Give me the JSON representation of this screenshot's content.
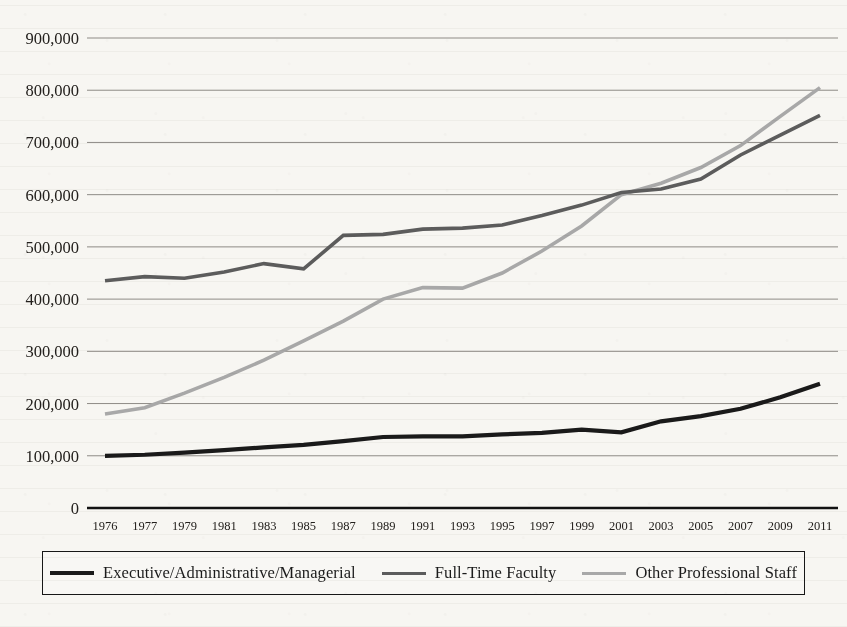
{
  "chart_data": {
    "type": "line",
    "title": "",
    "subtitle": "",
    "xlabel": "",
    "ylabel": "",
    "grid": true,
    "legend_position": "bottom",
    "x": [
      "1976",
      "1977",
      "1979",
      "1981",
      "1983",
      "1985",
      "1987",
      "1989",
      "1991",
      "1993",
      "1995",
      "1997",
      "1999",
      "2001",
      "2003",
      "2005",
      "2007",
      "2009",
      "2011"
    ],
    "xlim": [
      "1976",
      "2011"
    ],
    "ylim": [
      0,
      900000
    ],
    "ytick_values": [
      0,
      100000,
      200000,
      300000,
      400000,
      500000,
      600000,
      700000,
      800000,
      900000
    ],
    "ytick_labels": [
      "0",
      "100,000",
      "200,000",
      "300,000",
      "400,000",
      "500,000",
      "600,000",
      "700,000",
      "800,000",
      "900,000"
    ],
    "series": [
      {
        "name": "Executive/Administrative/Managerial",
        "color": "#1a1a1a",
        "width": 4.2,
        "values": [
          100000,
          102000,
          106000,
          111000,
          116000,
          121000,
          128000,
          136000,
          137000,
          137000,
          141000,
          144000,
          150000,
          145000,
          166000,
          176000,
          190000,
          212000,
          238000
        ]
      },
      {
        "name": "Full-Time Faculty",
        "color": "#5c5c5c",
        "width": 3.6,
        "values": [
          435000,
          443000,
          440000,
          452000,
          468000,
          458000,
          522000,
          524000,
          534000,
          536000,
          542000,
          560000,
          580000,
          604000,
          611000,
          630000,
          676000,
          714000,
          752000
        ]
      },
      {
        "name": "Other Professional Staff",
        "color": "#a8a8a8",
        "width": 3.6,
        "values": [
          180000,
          192000,
          220000,
          250000,
          283000,
          320000,
          358000,
          400000,
          422000,
          421000,
          450000,
          492000,
          540000,
          600000,
          622000,
          652000,
          694000,
          750000,
          805000
        ]
      }
    ]
  },
  "legend": {
    "entries": [
      {
        "label": "Executive/Administrative/Managerial",
        "color": "#1a1a1a",
        "thickness": 4.2
      },
      {
        "label": "Full-Time Faculty",
        "color": "#5c5c5c",
        "thickness": 3.6
      },
      {
        "label": "Other Professional Staff",
        "color": "#a8a8a8",
        "thickness": 3.2
      }
    ]
  }
}
